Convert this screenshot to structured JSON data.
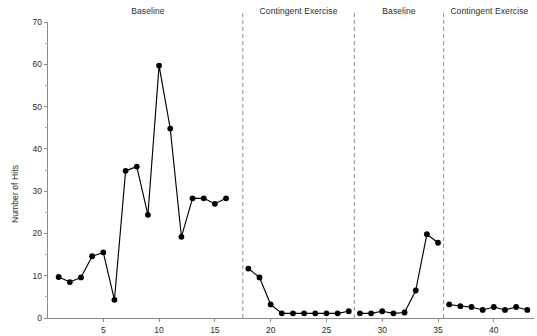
{
  "chart_data": {
    "type": "line",
    "title": "",
    "xlabel": "",
    "ylabel": "Number of Hits",
    "xlim": [
      0,
      43.6
    ],
    "ylim": [
      0,
      70
    ],
    "grid": false,
    "legend": "none",
    "y_ticks": [
      0,
      10,
      20,
      30,
      40,
      50,
      60,
      70
    ],
    "y_minor_ticks": [
      5,
      15,
      25,
      35,
      45,
      55,
      65
    ],
    "x_ticks": [
      5,
      10,
      15,
      20,
      25,
      30,
      35,
      40
    ],
    "marker": "filled-circle",
    "series": [
      {
        "name": "Number of Hits",
        "x": [
          1,
          2,
          3,
          4,
          5,
          6,
          7,
          8,
          9,
          10,
          11,
          12,
          13,
          14,
          15,
          16,
          18,
          19,
          20,
          21,
          22,
          23,
          24,
          25,
          26,
          27,
          28,
          29,
          30,
          31,
          32,
          33,
          34,
          35,
          36,
          37,
          38,
          39,
          40,
          41,
          42,
          43
        ],
        "values": [
          9.7,
          8.5,
          9.6,
          14.6,
          15.5,
          4.3,
          34.8,
          35.8,
          24.4,
          59.7,
          44.8,
          19.2,
          28.3,
          28.3,
          27.0,
          28.3,
          11.7,
          9.6,
          3.2,
          1.1,
          1.1,
          1.1,
          1.1,
          1.1,
          1.1,
          1.6,
          1.1,
          1.1,
          1.6,
          1.1,
          1.3,
          6.5,
          19.8,
          17.8,
          3.2,
          2.8,
          2.6,
          1.9,
          2.6,
          1.9,
          2.6,
          1.9
        ]
      }
    ],
    "phase_dividers": [
      17.5,
      27.5,
      35.5
    ],
    "phases": [
      {
        "label": "Baseline",
        "center_x": 9.0
      },
      {
        "label": "Contingent Exercise",
        "center_x": 22.5
      },
      {
        "label": "Baseline",
        "center_x": 31.5
      },
      {
        "label": "Contingent Exercise",
        "center_x": 39.6
      }
    ],
    "colors": {
      "line": "#000000",
      "marker": "#000000",
      "axis": "#8a8a8a",
      "divider": "#9a9a9a",
      "text": "#2b2b2b",
      "background": "#ffffff"
    }
  }
}
